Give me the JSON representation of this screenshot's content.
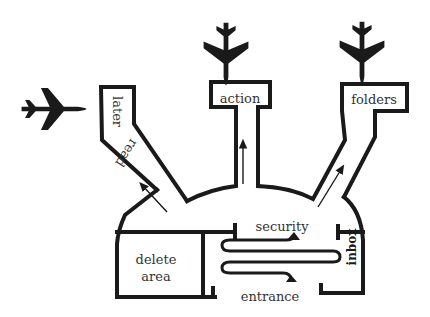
{
  "diagram": {
    "title": "",
    "gates": [
      {
        "label": "action"
      },
      {
        "label": "folders"
      },
      {
        "label_top": "later",
        "label_bottom": "read"
      }
    ],
    "areas": {
      "security": "security",
      "delete_area_line1": "delete",
      "delete_area_line2": "area",
      "entrance": "entrance",
      "inbox": "inbox"
    },
    "icons": [
      "airplane-icon",
      "airplane-icon",
      "airplane-icon"
    ],
    "colors": {
      "ink": "#1a1a1a",
      "background": "#ffffff"
    }
  }
}
